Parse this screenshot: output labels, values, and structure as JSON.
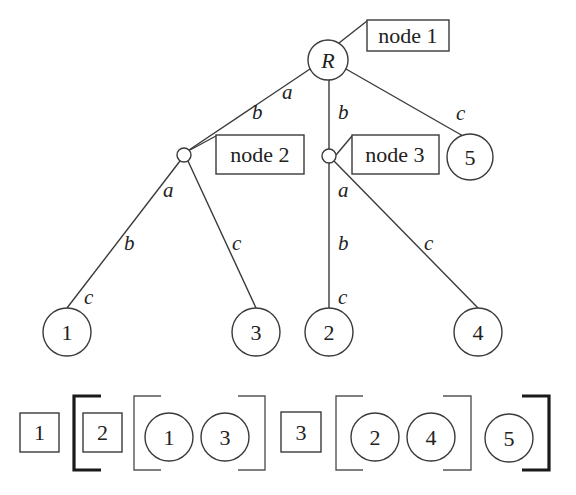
{
  "tree": {
    "root": {
      "label": "R"
    },
    "node_labels": {
      "node1": "node 1",
      "node2": "node 2",
      "node3": "node 3"
    },
    "leaves": {
      "leaf1": "1",
      "leaf2": "2",
      "leaf3": "3",
      "leaf4": "4",
      "leaf5": "5"
    },
    "edge_labels": {
      "root_to_node2_a": "a",
      "root_to_node2_b": "b",
      "root_to_node3_b": "b",
      "root_to_leaf5_c": "c",
      "node2_to_leaf1_a": "a",
      "node2_to_leaf1_b": "b",
      "node2_to_leaf1_c": "c",
      "node2_to_leaf3_c": "c",
      "node3_to_leaf2_a": "a",
      "node3_to_leaf2_b": "b",
      "node3_to_leaf2_c": "c",
      "node3_to_leaf4_c": "c"
    }
  },
  "serialization": {
    "items": [
      {
        "type": "box",
        "label": "1"
      },
      {
        "type": "thick-open-bracket"
      },
      {
        "type": "box",
        "label": "2"
      },
      {
        "type": "thin-open-bracket"
      },
      {
        "type": "circle",
        "label": "1"
      },
      {
        "type": "circle",
        "label": "3"
      },
      {
        "type": "thin-close-bracket"
      },
      {
        "type": "box",
        "label": "3"
      },
      {
        "type": "thin-open-bracket"
      },
      {
        "type": "circle",
        "label": "2"
      },
      {
        "type": "circle",
        "label": "4"
      },
      {
        "type": "thin-close-bracket"
      },
      {
        "type": "circle",
        "label": "5"
      },
      {
        "type": "thick-close-bracket"
      }
    ],
    "labels": {
      "box1": "1",
      "box2": "2",
      "circ1": "1",
      "circ3": "3",
      "box3": "3",
      "circ2": "2",
      "circ4": "4",
      "circ5": "5"
    }
  },
  "colors": {
    "stroke": "#3a3a3a",
    "text": "#222222",
    "background": "#ffffff"
  }
}
